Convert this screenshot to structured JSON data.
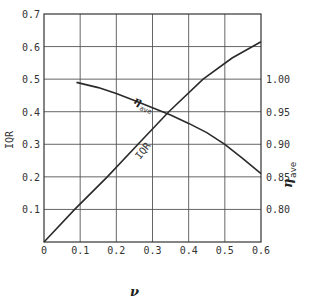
{
  "chart_data": {
    "type": "line",
    "title": "",
    "xlabel": "ν",
    "ylabel": "IQR",
    "y2label": "η_ave",
    "xlim": [
      0,
      0.6
    ],
    "ylim": [
      0,
      0.7
    ],
    "y2lim": [
      0.75,
      1.1
    ],
    "grid": true,
    "x_ticks": [
      "0",
      "0.1",
      "0.2",
      "0.3",
      "0.4",
      "0.5",
      "0.6"
    ],
    "y_ticks": [
      "0.1",
      "0.2",
      "0.3",
      "0.4",
      "0.5",
      "0.6",
      "0.7"
    ],
    "y2_ticks": [
      "0.80",
      "0.85",
      "0.90",
      "0.95",
      "1.00"
    ],
    "series": [
      {
        "name": "IQR",
        "axis": "left",
        "label": "IQR",
        "x": [
          0,
          0.085,
          0.175,
          0.26,
          0.345,
          0.44,
          0.52,
          0.6
        ],
        "values": [
          0,
          0.1,
          0.2,
          0.3,
          0.4,
          0.5,
          0.565,
          0.615
        ]
      },
      {
        "name": "η_ave",
        "axis": "right",
        "label": "η",
        "label_sub": "ave",
        "x": [
          0.09,
          0.15,
          0.2,
          0.25,
          0.3,
          0.35,
          0.4,
          0.45,
          0.5,
          0.55,
          0.6
        ],
        "values": [
          0.995,
          0.987,
          0.978,
          0.967,
          0.956,
          0.945,
          0.932,
          0.918,
          0.9,
          0.878,
          0.855
        ]
      }
    ],
    "legend": "none (inline curve labels)"
  },
  "axes": {
    "x_title": "ν",
    "y_title": "IQR",
    "y2_title_main": "η",
    "y2_title_sub": "ave"
  }
}
